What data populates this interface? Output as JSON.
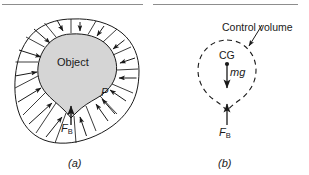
{
  "figure": {
    "panel_a": {
      "caption": "(a)",
      "object_label": "Object",
      "pressure_label": "P",
      "buoyant_force_label": "F",
      "buoyant_force_sub": "B",
      "object_fill": "#d5d5d5",
      "stroke": "#1a1a1a",
      "arrow_count": 16
    },
    "panel_b": {
      "caption": "(b)",
      "control_volume_label": "Control volume",
      "cg_label": "CG",
      "weight_label": "mg",
      "buoyant_force_label": "F",
      "buoyant_force_sub": "B",
      "stroke": "#1a1a1a",
      "dash_pattern": "5,4"
    },
    "rules": {
      "color": "#8d8d8d",
      "left": {
        "x": 2,
        "y": 4,
        "width": 141
      },
      "right": {
        "x": 153,
        "y": 4,
        "width": 145
      }
    }
  }
}
